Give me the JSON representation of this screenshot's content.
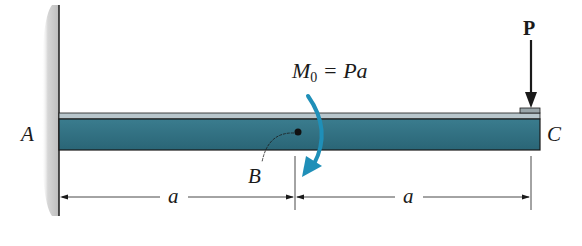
{
  "diagram": {
    "type": "cantilever-beam",
    "labels": {
      "support_end": "A",
      "free_end": "C",
      "midpoint": "B",
      "force": "P",
      "moment_symbol": "M",
      "moment_subscript": "0",
      "moment_equals": " = Pa",
      "dim_left": "a",
      "dim_right": "a"
    },
    "colors": {
      "beam_fill": "#2f6e80",
      "beam_top_strip": "#b8c6cc",
      "moment_arrow": "#1f8fb8",
      "wall": "#c8c8c8",
      "line": "#1a1a1a"
    }
  }
}
